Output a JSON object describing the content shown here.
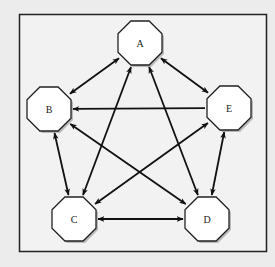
{
  "diagram": {
    "type": "directed-graph",
    "frame": {
      "x": 19,
      "y": 14,
      "width": 247,
      "height": 237
    },
    "colors": {
      "background": "#ececec",
      "frame_fill": "#f2f2f2",
      "frame_stroke": "#222222",
      "node_fill": "#ffffff",
      "node_stroke": "#222222",
      "node_shadow": "#8a8a8a",
      "edge": "#111111"
    },
    "node_shape": "octagon",
    "nodes": [
      {
        "id": "A",
        "label": "A",
        "x": 140,
        "y": 43
      },
      {
        "id": "B",
        "label": "B",
        "x": 49,
        "y": 109
      },
      {
        "id": "C",
        "label": "C",
        "x": 74,
        "y": 219
      },
      {
        "id": "D",
        "label": "D",
        "x": 207,
        "y": 219
      },
      {
        "id": "E",
        "label": "E",
        "x": 229,
        "y": 108
      }
    ],
    "edges": [
      {
        "from": "A",
        "to": "B",
        "direction": "both"
      },
      {
        "from": "A",
        "to": "E",
        "direction": "both"
      },
      {
        "from": "A",
        "to": "C",
        "direction": "both"
      },
      {
        "from": "A",
        "to": "D",
        "direction": "both"
      },
      {
        "from": "E",
        "to": "B",
        "direction": "forward"
      },
      {
        "from": "B",
        "to": "C",
        "direction": "both"
      },
      {
        "from": "B",
        "to": "D",
        "direction": "both"
      },
      {
        "from": "E",
        "to": "C",
        "direction": "both"
      },
      {
        "from": "E",
        "to": "D",
        "direction": "both"
      },
      {
        "from": "C",
        "to": "D",
        "direction": "both"
      }
    ]
  }
}
